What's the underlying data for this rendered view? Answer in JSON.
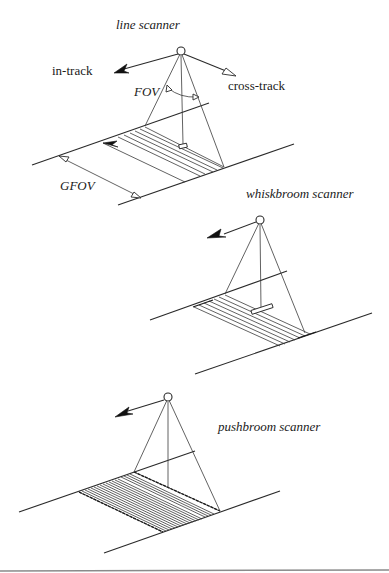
{
  "figure": {
    "type": "diagram",
    "background": "#ffffff",
    "line_color": "#2a2a2a",
    "panels": [
      {
        "id": "line-scanner",
        "title": "line scanner",
        "labels": {
          "in_track": "in-track",
          "cross_track": "cross-track",
          "fov": "FOV",
          "gfov": "GFOV"
        }
      },
      {
        "id": "whiskbroom-scanner",
        "title": "whiskbroom scanner"
      },
      {
        "id": "pushbroom-scanner",
        "title": "pushbroom scanner"
      }
    ]
  },
  "icons": {
    "satellite": "circle",
    "direction_arrow": "filled-triangle-arrowhead",
    "cross_track_arrow": "open-triangle-arrowhead"
  }
}
